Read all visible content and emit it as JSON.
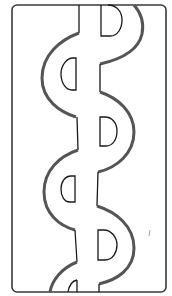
{
  "title": "Serpentine band line drawing",
  "colors": {
    "background": "#ffffff",
    "frame": "#3a3a3a",
    "band_outline": "#555555",
    "inner_line": "#1a1a1a"
  },
  "elements": {
    "frame": "rounded rectangle frame",
    "band": "wavy S-shaped serpentine band",
    "half_circles": [
      "right-half D top",
      "left-half D",
      "right-half D middle",
      "left-half D lower",
      "right-half D bottom",
      "left-half D partial"
    ]
  }
}
